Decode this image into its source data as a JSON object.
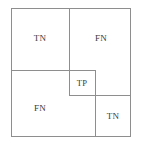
{
  "diagram": {
    "type": "nested-rectangle-partition",
    "background_color": "#ffffff",
    "line_color": "#8e8e8e",
    "text_color": "#3a3a3a",
    "regions": [
      {
        "id": "top-left",
        "label": "TN"
      },
      {
        "id": "top-right",
        "label": "FN"
      },
      {
        "id": "center",
        "label": "TP"
      },
      {
        "id": "bottom-left",
        "label": "FN"
      },
      {
        "id": "bottom-right",
        "label": "TN"
      }
    ]
  }
}
